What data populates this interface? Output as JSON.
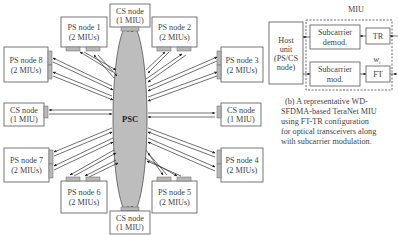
{
  "network": {
    "hub": {
      "label": "PSC"
    },
    "nodes": [
      {
        "id": "cs-top",
        "line1": "CS node",
        "line2": "(1 MIU)"
      },
      {
        "id": "ps1",
        "line1": "PS node 1",
        "line2": "(2 MIUs)"
      },
      {
        "id": "ps2",
        "line1": "PS node 2",
        "line2": "(2 MIUs)"
      },
      {
        "id": "ps3",
        "line1": "PS node 3",
        "line2": "(2 MIUs)"
      },
      {
        "id": "cs-right",
        "line1": "CS node",
        "line2": "(1 MIU)"
      },
      {
        "id": "ps4",
        "line1": "PS node 4",
        "line2": "(2 MIUs)"
      },
      {
        "id": "ps5",
        "line1": "PS node 5",
        "line2": "(2 MIUs)"
      },
      {
        "id": "cs-bottom",
        "line1": "CS node",
        "line2": "(1 MIU)"
      },
      {
        "id": "ps6",
        "line1": "PS node 6",
        "line2": "(2 MIUs)"
      },
      {
        "id": "ps7",
        "line1": "PS node 7",
        "line2": "(2 MIUs)"
      },
      {
        "id": "cs-left",
        "line1": "CS node",
        "line2": "(1 MIU)"
      },
      {
        "id": "ps8",
        "line1": "PS node 8",
        "line2": "(2 MIUs)"
      }
    ]
  },
  "miu": {
    "title": "MIU",
    "host": {
      "line1": "Host",
      "line2": "unit",
      "line3": "(PS/CS",
      "line4": "node)"
    },
    "demod": {
      "line1": "Subcarrier",
      "line2": "demod."
    },
    "mod": {
      "line1": "Subcarrier",
      "line2": "mod."
    },
    "tr": "TR",
    "ft": "FT",
    "wavelength": "w",
    "wavelength_sub": "i"
  },
  "caption": {
    "lines": [
      "(b) A representative WD-",
      "SFDMA-based TeraNet MIU",
      "using FT-TR configuration",
      "for optical transceivers along",
      "with subcarrier modulation."
    ]
  }
}
